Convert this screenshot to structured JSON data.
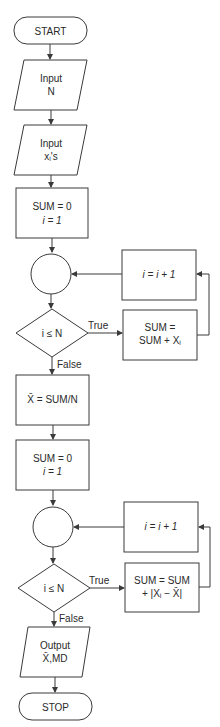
{
  "flowchart": {
    "start": "START",
    "input_n": [
      "Input",
      "N"
    ],
    "input_x": [
      "Input",
      "xᵢ's"
    ],
    "init1": [
      "SUM = 0",
      "i = 1"
    ],
    "incr1": "i = i + 1",
    "cond1": "i ≤ N",
    "true1": "True",
    "false1": "False",
    "accum1": [
      "SUM =",
      "SUM + Xᵢ"
    ],
    "mean": "X̄ = SUM/N",
    "init2": [
      "SUM = 0",
      "i = 1"
    ],
    "incr2": "i = i + 1",
    "cond2": "i ≤ N",
    "true2": "True",
    "false2": "False",
    "accum2": [
      "SUM = SUM",
      "+ |Xᵢ − X̄|"
    ],
    "output": [
      "Output",
      "X̄,MD"
    ],
    "stop": "STOP"
  }
}
